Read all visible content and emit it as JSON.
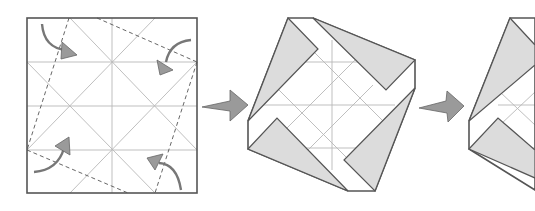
{
  "diagram": {
    "type": "origami-folding-sequence",
    "steps": [
      {
        "id": 1,
        "description": "Square with crease grid; fold four corners inward along dashed valley lines",
        "arrows": [
          "top-left-curved-arrow",
          "top-right-curved-arrow",
          "bottom-left-curved-arrow",
          "bottom-right-curved-arrow"
        ]
      },
      {
        "id": 2,
        "description": "Result: tilted pinwheel-like square with four grey flaps"
      },
      {
        "id": 3,
        "description": "Next step (partially visible, cropped at right edge)"
      }
    ],
    "transition_arrows": 2,
    "colors": {
      "edge": "#555555",
      "crease": "#b8b8b8",
      "flap": "#dcdcdc",
      "arrow": "#9a9a9a"
    }
  }
}
